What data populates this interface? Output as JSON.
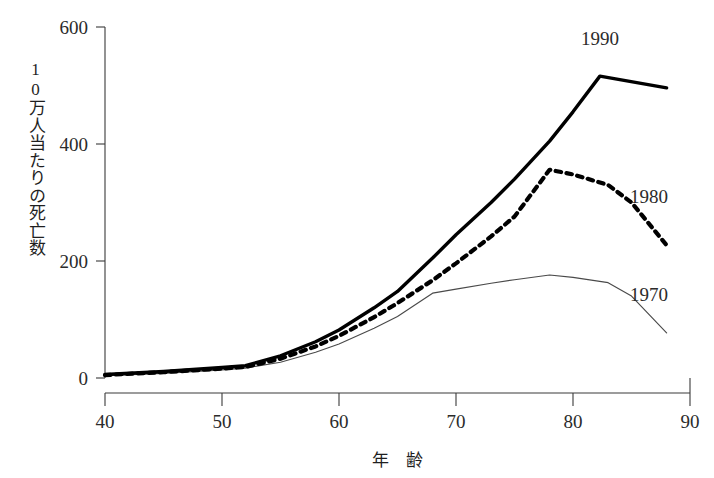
{
  "chart_data": {
    "type": "line",
    "title": "",
    "subtitle": "",
    "xlabel": "年　齢",
    "ylabel": "10万人当たりの死亡数",
    "xlim": [
      40,
      90
    ],
    "ylim": [
      0,
      600
    ],
    "xticks": [
      "40",
      "50",
      "60",
      "70",
      "80",
      "90"
    ],
    "xtick_values": [
      40,
      50,
      60,
      70,
      80,
      90
    ],
    "yticks": [
      "0",
      "200",
      "400",
      "600"
    ],
    "ytick_values": [
      0,
      200,
      400,
      600
    ],
    "grid": false,
    "legend_position": "inline-right-of-line-end",
    "background_color": "#ffffff",
    "line_color": "#000000",
    "series": [
      {
        "name": "1990",
        "label": "1990",
        "style": "solid-thick",
        "color": "#000000",
        "x": [
          40,
          45,
          50,
          52,
          55,
          58,
          60,
          63,
          65,
          68,
          70,
          73,
          75,
          78,
          80,
          82.3,
          88
        ],
        "values": [
          6,
          11,
          18,
          21,
          38,
          62,
          82,
          120,
          148,
          205,
          245,
          300,
          340,
          405,
          455,
          516,
          496
        ]
      },
      {
        "name": "1980",
        "label": "1980",
        "style": "dashed-thick",
        "color": "#000000",
        "x": [
          40,
          45,
          50,
          52,
          55,
          58,
          60,
          63,
          65,
          68,
          70,
          73,
          75,
          78,
          80,
          83,
          85,
          88
        ],
        "values": [
          5,
          10,
          16,
          19,
          33,
          54,
          72,
          104,
          128,
          167,
          196,
          242,
          276,
          356,
          348,
          330,
          300,
          227
        ]
      },
      {
        "name": "1970",
        "label": "1970",
        "style": "solid-thin",
        "color": "#4a4a4a",
        "x": [
          40,
          45,
          50,
          52,
          55,
          58,
          60,
          63,
          65,
          68,
          70,
          73,
          75,
          78,
          80,
          83,
          85,
          88
        ],
        "values": [
          4,
          8,
          14,
          17,
          27,
          44,
          58,
          85,
          105,
          145,
          152,
          162,
          168,
          176,
          172,
          163,
          140,
          77
        ]
      }
    ],
    "annotations": [
      {
        "text": "1990",
        "x": 82.3,
        "y": 570,
        "series": "1990"
      },
      {
        "text": "1980",
        "x": 86.5,
        "y": 300,
        "series": "1980"
      },
      {
        "text": "1970",
        "x": 86.5,
        "y": 132,
        "series": "1970"
      }
    ]
  },
  "axes": {
    "y_axis_title": "10万人当たりの死亡数",
    "x_axis_title": "年　齢"
  }
}
